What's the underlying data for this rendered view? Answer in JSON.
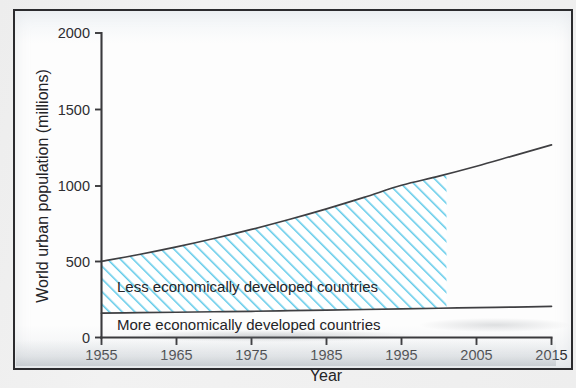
{
  "figure": {
    "frame_border_color": "#2b2b2e",
    "page_background": "#efefef"
  },
  "chart_data": {
    "type": "area",
    "title": "",
    "xlabel": "Year",
    "ylabel": "World urban population (millions)",
    "xlim": [
      1955,
      2015
    ],
    "ylim": [
      0,
      2000
    ],
    "xticks": [
      1955,
      1965,
      1975,
      1985,
      1995,
      2005,
      2015
    ],
    "yticks": [
      0,
      500,
      1000,
      1500,
      2000
    ],
    "grid": false,
    "legend_position": "inline-band-labels",
    "hatch_color": "#5ec8e8",
    "hatch_pattern": "diagonal-lines",
    "hatch_fill_end_year": 2001,
    "series": [
      {
        "name": "More economically developed countries",
        "label_in_band": "More economically developed countries",
        "x": [
          1955,
          1960,
          1965,
          1970,
          1975,
          1980,
          1985,
          1990,
          1995,
          2000,
          2005,
          2010,
          2015
        ],
        "values": [
          160,
          163,
          166,
          169,
          172,
          176,
          180,
          184,
          188,
          192,
          196,
          200,
          204
        ]
      },
      {
        "name": "Less economically developed countries (cumulative total)",
        "label_in_band": "Less economically developed countries",
        "x": [
          1955,
          1960,
          1965,
          1970,
          1975,
          1980,
          1985,
          1990,
          1995,
          2000,
          2005,
          2010,
          2015
        ],
        "values": [
          500,
          545,
          595,
          650,
          710,
          775,
          845,
          920,
          1000,
          1060,
          1125,
          1195,
          1265
        ]
      }
    ],
    "annotations": [
      {
        "text": "Less economically developed countries",
        "x": 1960,
        "y": 370
      },
      {
        "text": "More economically developed countries",
        "x": 1960,
        "y": 105
      }
    ]
  },
  "axis": {
    "y_title": "World urban population (millions)",
    "x_title": "Year",
    "y_tick_labels": [
      "2000",
      "1500",
      "1000",
      "500",
      "0"
    ],
    "x_tick_labels": [
      "1955",
      "1965",
      "1975",
      "1985",
      "1995",
      "2005",
      "2015"
    ]
  },
  "labels": {
    "less_developed": "Less economically developed countries",
    "more_developed": "More economically developed countries"
  }
}
